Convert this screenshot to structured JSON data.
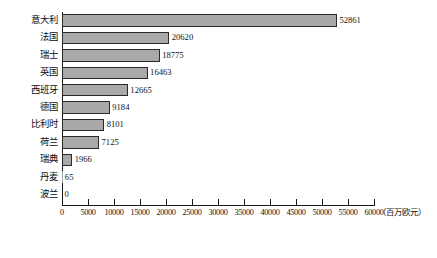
{
  "chart_data": {
    "type": "bar",
    "orientation": "horizontal",
    "title": "",
    "xlabel": "（百万欧元）",
    "ylabel": "",
    "xlim": [
      0,
      60000
    ],
    "grid": false,
    "legend": null,
    "categories": [
      "意大利",
      "法国",
      "瑞士",
      "英国",
      "西班牙",
      "德国",
      "比利时",
      "荷兰",
      "瑞典",
      "丹麦",
      "波兰"
    ],
    "values": [
      52861,
      20620,
      18775,
      16463,
      12665,
      9184,
      8101,
      7125,
      1966,
      65,
      0
    ],
    "value_labels": [
      "52861",
      "20620",
      "18775",
      "16463",
      "12665",
      "9184",
      "8101",
      "7125",
      "1966",
      "65",
      "0"
    ],
    "xticks": [
      0,
      5000,
      10000,
      15000,
      20000,
      25000,
      30000,
      35000,
      40000,
      45000,
      50000,
      55000,
      60000
    ],
    "xtick_labels": [
      "0",
      "5000",
      "10000",
      "15000",
      "20000",
      "25000",
      "30000",
      "35000",
      "40000",
      "45000",
      "50000",
      "55000",
      "60000"
    ],
    "bar_color": "#a9a9a9",
    "bar_border_color": "#2a2a2a",
    "axis_color": "#1b1b1b"
  },
  "caption": ""
}
